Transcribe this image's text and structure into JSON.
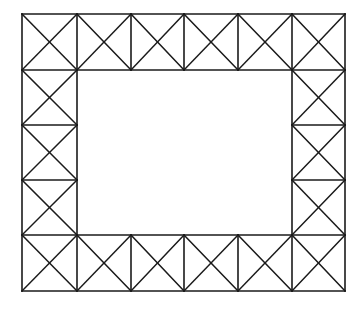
{
  "figure": {
    "background_color": "#ffffff",
    "line_color": "#1a1a1a",
    "line_width": 1.6,
    "canvas": {
      "width": 362,
      "height": 309
    }
  },
  "chart_data": {
    "type": "diagram",
    "xlabel": "",
    "ylabel": "",
    "xlim": [
      0,
      362
    ],
    "ylim": [
      0,
      309
    ],
    "grid": false,
    "legend": "none",
    "outer_rect": {
      "x1": 22,
      "y1": 14,
      "x2": 345,
      "y2": 291
    },
    "inner_rect": {
      "x1": 77,
      "y1": 70,
      "x2": 292,
      "y2": 235
    },
    "vertical_stations": [
      22,
      77,
      131,
      184,
      238,
      292,
      345
    ],
    "horizontal_stations": [
      14,
      70,
      125,
      180,
      235,
      291
    ],
    "panel_counts": {
      "top": 6,
      "bottom": 6,
      "left": 3,
      "right": 3,
      "total": 18
    },
    "panel_bracing": "X (both diagonals in every panel)",
    "panels": [
      {
        "name": "top-1",
        "band": "top",
        "x1": 22,
        "y1": 14,
        "x2": 77,
        "y2": 70,
        "bracing": "X"
      },
      {
        "name": "top-2",
        "band": "top",
        "x1": 77,
        "y1": 14,
        "x2": 131,
        "y2": 70,
        "bracing": "X"
      },
      {
        "name": "top-3",
        "band": "top",
        "x1": 131,
        "y1": 14,
        "x2": 184,
        "y2": 70,
        "bracing": "X"
      },
      {
        "name": "top-4",
        "band": "top",
        "x1": 184,
        "y1": 14,
        "x2": 238,
        "y2": 70,
        "bracing": "X"
      },
      {
        "name": "top-5",
        "band": "top",
        "x1": 238,
        "y1": 14,
        "x2": 292,
        "y2": 70,
        "bracing": "X"
      },
      {
        "name": "top-6",
        "band": "top",
        "x1": 292,
        "y1": 14,
        "x2": 345,
        "y2": 70,
        "bracing": "X"
      },
      {
        "name": "left-1",
        "band": "left",
        "x1": 22,
        "y1": 70,
        "x2": 77,
        "y2": 125,
        "bracing": "X"
      },
      {
        "name": "left-2",
        "band": "left",
        "x1": 22,
        "y1": 125,
        "x2": 77,
        "y2": 180,
        "bracing": "X"
      },
      {
        "name": "left-3",
        "band": "left",
        "x1": 22,
        "y1": 180,
        "x2": 77,
        "y2": 235,
        "bracing": "X"
      },
      {
        "name": "right-1",
        "band": "right",
        "x1": 292,
        "y1": 70,
        "x2": 345,
        "y2": 125,
        "bracing": "X"
      },
      {
        "name": "right-2",
        "band": "right",
        "x1": 292,
        "y1": 125,
        "x2": 345,
        "y2": 180,
        "bracing": "X"
      },
      {
        "name": "right-3",
        "band": "right",
        "x1": 292,
        "y1": 180,
        "x2": 345,
        "y2": 235,
        "bracing": "X"
      },
      {
        "name": "bottom-1",
        "band": "bottom",
        "x1": 22,
        "y1": 235,
        "x2": 77,
        "y2": 291,
        "bracing": "X"
      },
      {
        "name": "bottom-2",
        "band": "bottom",
        "x1": 77,
        "y1": 235,
        "x2": 131,
        "y2": 291,
        "bracing": "X"
      },
      {
        "name": "bottom-3",
        "band": "bottom",
        "x1": 131,
        "y1": 235,
        "x2": 184,
        "y2": 291,
        "bracing": "X"
      },
      {
        "name": "bottom-4",
        "band": "bottom",
        "x1": 184,
        "y1": 235,
        "x2": 238,
        "y2": 291,
        "bracing": "X"
      },
      {
        "name": "bottom-5",
        "band": "bottom",
        "x1": 238,
        "y1": 235,
        "x2": 292,
        "y2": 291,
        "bracing": "X"
      },
      {
        "name": "bottom-6",
        "band": "bottom",
        "x1": 292,
        "y1": 235,
        "x2": 345,
        "y2": 291,
        "bracing": "X"
      }
    ],
    "chords": [
      {
        "name": "outer-top",
        "x1": 22,
        "y1": 14,
        "x2": 345,
        "y2": 14
      },
      {
        "name": "outer-bottom",
        "x1": 22,
        "y1": 291,
        "x2": 345,
        "y2": 291
      },
      {
        "name": "outer-left",
        "x1": 22,
        "y1": 14,
        "x2": 22,
        "y2": 291
      },
      {
        "name": "outer-right",
        "x1": 345,
        "y1": 14,
        "x2": 345,
        "y2": 291
      },
      {
        "name": "inner-top",
        "x1": 22,
        "y1": 70,
        "x2": 345,
        "y2": 70
      },
      {
        "name": "inner-bottom",
        "x1": 22,
        "y1": 235,
        "x2": 345,
        "y2": 235
      },
      {
        "name": "inner-left",
        "x1": 77,
        "y1": 14,
        "x2": 77,
        "y2": 291
      },
      {
        "name": "inner-right",
        "x1": 292,
        "y1": 14,
        "x2": 292,
        "y2": 291
      }
    ],
    "web_verticals": [
      {
        "name": "top-web-131",
        "x1": 131,
        "y1": 14,
        "x2": 131,
        "y2": 70
      },
      {
        "name": "top-web-184",
        "x1": 184,
        "y1": 14,
        "x2": 184,
        "y2": 70
      },
      {
        "name": "top-web-238",
        "x1": 238,
        "y1": 14,
        "x2": 238,
        "y2": 70
      },
      {
        "name": "bottom-web-131",
        "x1": 131,
        "y1": 235,
        "x2": 131,
        "y2": 291
      },
      {
        "name": "bottom-web-184",
        "x1": 184,
        "y1": 235,
        "x2": 184,
        "y2": 291
      },
      {
        "name": "bottom-web-238",
        "x1": 238,
        "y1": 235,
        "x2": 238,
        "y2": 291
      }
    ],
    "web_horizontals": [
      {
        "name": "left-web-125",
        "x1": 22,
        "y1": 125,
        "x2": 77,
        "y2": 125
      },
      {
        "name": "left-web-180",
        "x1": 22,
        "y1": 180,
        "x2": 77,
        "y2": 180
      },
      {
        "name": "right-web-125",
        "x1": 292,
        "y1": 125,
        "x2": 345,
        "y2": 125
      },
      {
        "name": "right-web-180",
        "x1": 292,
        "y1": 180,
        "x2": 345,
        "y2": 180
      }
    ]
  }
}
